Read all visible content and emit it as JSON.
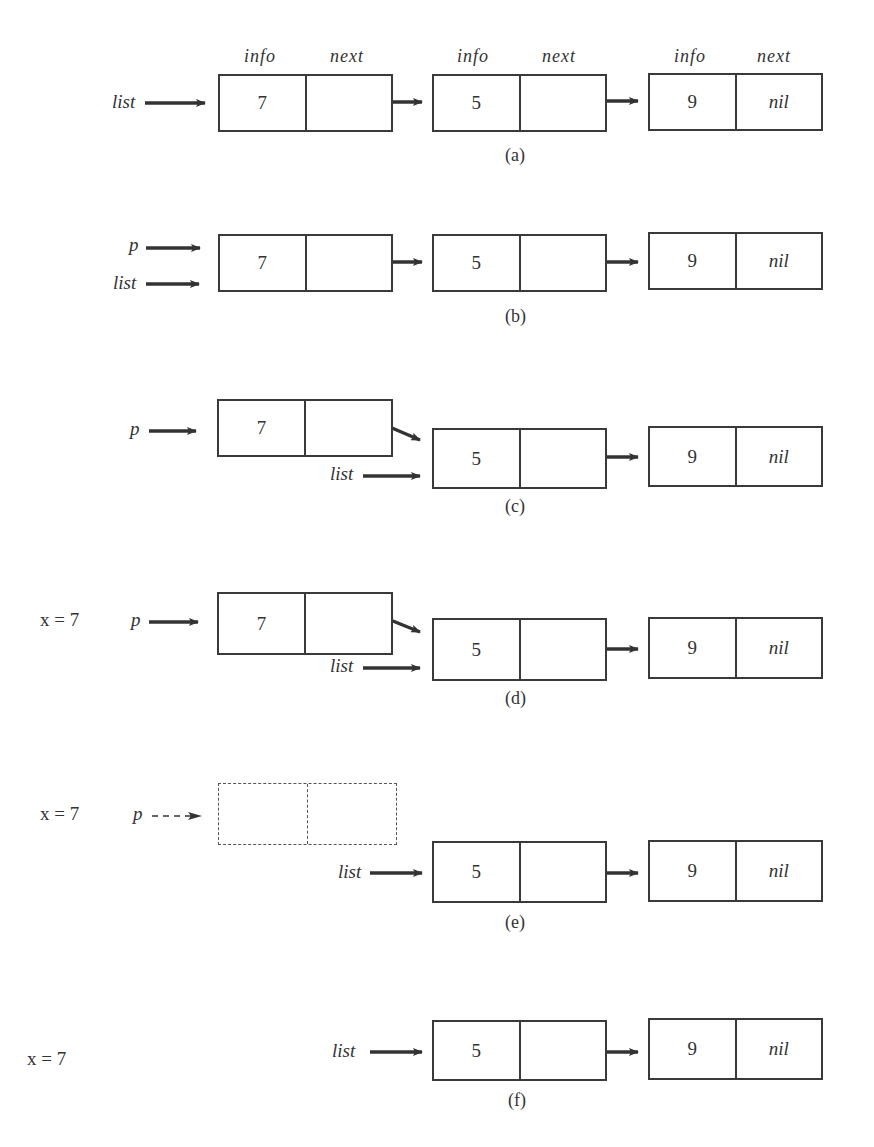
{
  "headers": {
    "info": "info",
    "next": "next"
  },
  "panels": [
    {
      "caption": "(a)",
      "pointers": [
        {
          "name": "list",
          "label": "list",
          "target": "node1"
        }
      ],
      "nodes": [
        {
          "info": "7",
          "next": ""
        },
        {
          "info": "5",
          "next": ""
        },
        {
          "info": "9",
          "next": "nil"
        }
      ]
    },
    {
      "caption": "(b)",
      "pointers": [
        {
          "name": "p",
          "label": "p",
          "target": "node1"
        },
        {
          "name": "list",
          "label": "list",
          "target": "node1"
        }
      ],
      "nodes": [
        {
          "info": "7",
          "next": ""
        },
        {
          "info": "5",
          "next": ""
        },
        {
          "info": "9",
          "next": "nil"
        }
      ]
    },
    {
      "caption": "(c)",
      "pointers": [
        {
          "name": "p",
          "label": "p",
          "target": "node1"
        },
        {
          "name": "list",
          "label": "list",
          "target": "node2"
        }
      ],
      "nodes": [
        {
          "info": "7",
          "next": ""
        },
        {
          "info": "5",
          "next": ""
        },
        {
          "info": "9",
          "next": "nil"
        }
      ]
    },
    {
      "caption": "(d)",
      "variable": "x = 7",
      "pointers": [
        {
          "name": "p",
          "label": "p",
          "target": "node1"
        },
        {
          "name": "list",
          "label": "list",
          "target": "node2"
        }
      ],
      "nodes": [
        {
          "info": "7",
          "next": ""
        },
        {
          "info": "5",
          "next": ""
        },
        {
          "info": "9",
          "next": "nil"
        }
      ]
    },
    {
      "caption": "(e)",
      "variable": "x = 7",
      "pointers": [
        {
          "name": "p",
          "label": "p",
          "target": "freed-node",
          "style": "dashed"
        },
        {
          "name": "list",
          "label": "list",
          "target": "node2"
        }
      ],
      "nodes": [
        {
          "info": "",
          "next": "",
          "style": "dashed"
        },
        {
          "info": "5",
          "next": ""
        },
        {
          "info": "9",
          "next": "nil"
        }
      ]
    },
    {
      "caption": "(f)",
      "variable": "x = 7",
      "pointers": [
        {
          "name": "list",
          "label": "list",
          "target": "node2"
        }
      ],
      "nodes": [
        {
          "info": "5",
          "next": ""
        },
        {
          "info": "9",
          "next": "nil"
        }
      ]
    }
  ],
  "colors": {
    "ink": "#3a3a3a",
    "background": "#ffffff"
  }
}
